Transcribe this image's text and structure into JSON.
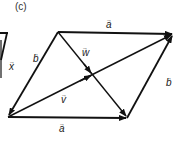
{
  "figure": {
    "panel_label": "(c)",
    "stroke_color": "#111111",
    "vectors": [
      {
        "name": "a",
        "label": "a",
        "from": [
          58,
          32
        ],
        "to": [
          173,
          34
        ],
        "role": "top-side"
      },
      {
        "name": "a",
        "label": "a",
        "from": [
          8,
          117
        ],
        "to": [
          127,
          118
        ],
        "role": "bottom-side"
      },
      {
        "name": "b",
        "label": "b",
        "from": [
          58,
          32
        ],
        "to": [
          8,
          117
        ],
        "role": "left-side"
      },
      {
        "name": "b",
        "label": "b",
        "from": [
          127,
          118
        ],
        "to": [
          173,
          34
        ],
        "role": "right-side"
      },
      {
        "name": "v",
        "label": "v",
        "from": [
          8,
          117
        ],
        "to": [
          173,
          34
        ],
        "role": "diagonal"
      },
      {
        "name": "w",
        "label": "w",
        "from": [
          58,
          32
        ],
        "to": [
          127,
          118
        ],
        "role": "diagonal"
      }
    ],
    "labels": {
      "a_top": "a",
      "a_bottom": "a",
      "b_left": "b",
      "b_right": "b",
      "v": "v",
      "w": "w",
      "x_partial": "x"
    }
  }
}
